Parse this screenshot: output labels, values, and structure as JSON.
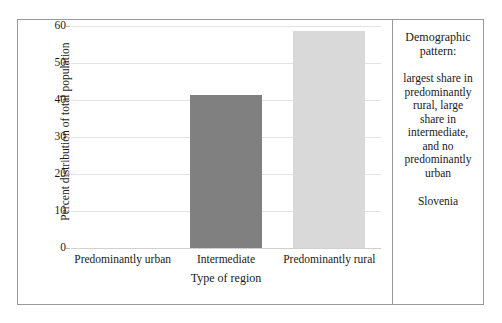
{
  "chart_data": {
    "type": "bar",
    "title": "",
    "categories": [
      "Predominantly urban",
      "Intermediate",
      "Predominantly rural"
    ],
    "values": [
      0,
      41.3,
      58.7
    ],
    "xlabel": "Type of region",
    "ylabel": "Percent distribution of total population",
    "ylim": [
      0,
      60
    ],
    "yticks": [
      0,
      10,
      20,
      30,
      40,
      50,
      60
    ],
    "ytick_labels": [
      "0",
      "10",
      "20",
      "30",
      "40",
      "50",
      "60"
    ],
    "grid": "horizontal",
    "legend": "none",
    "bar_colors": [
      "#ffffff",
      "#808080",
      "#d9d9d9"
    ]
  },
  "note": {
    "heading": "Demographic pattern:",
    "body": "largest share in predominantly rural, large share in intermediate, and no predominantly urban",
    "country": "Slovenia"
  },
  "colors": {
    "bar_dark": "#808080",
    "bar_light": "#d9d9d9",
    "gridline": "#e3e3e3",
    "frame_border": "#9a9a9a"
  }
}
